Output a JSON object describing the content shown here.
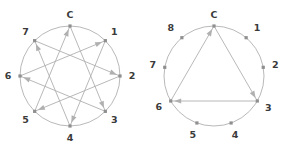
{
  "figures": [
    {
      "id": "octagram-figure",
      "name": "eight-point-star-diagram",
      "point_count": 8,
      "center": {
        "x": 70,
        "y": 76
      },
      "radius": 50,
      "nodes": [
        {
          "label": "C",
          "angle": -90,
          "label_offset": {
            "dx": 0,
            "dy": -11
          }
        },
        {
          "label": "1",
          "angle": -45,
          "label_offset": {
            "dx": 9,
            "dy": -8
          }
        },
        {
          "label": "2",
          "angle": 0,
          "label_offset": {
            "dx": 12,
            "dy": 0
          }
        },
        {
          "label": "3",
          "angle": 45,
          "label_offset": {
            "dx": 9,
            "dy": 9
          }
        },
        {
          "label": "4",
          "angle": 90,
          "label_offset": {
            "dx": 0,
            "dy": 12
          }
        },
        {
          "label": "5",
          "angle": 135,
          "label_offset": {
            "dx": -9,
            "dy": 9
          }
        },
        {
          "label": "6",
          "angle": 180,
          "label_offset": {
            "dx": -12,
            "dy": 0
          }
        },
        {
          "label": "7",
          "angle": -135,
          "label_offset": {
            "dx": -9,
            "dy": -8
          }
        }
      ],
      "edges": [
        {
          "from": 0,
          "to": 3,
          "arrow": true
        },
        {
          "from": 3,
          "to": 6,
          "arrow": true
        },
        {
          "from": 6,
          "to": 1,
          "arrow": true
        },
        {
          "from": 1,
          "to": 4,
          "arrow": true
        },
        {
          "from": 4,
          "to": 7,
          "arrow": true
        },
        {
          "from": 7,
          "to": 2,
          "arrow": true
        },
        {
          "from": 2,
          "to": 5,
          "arrow": true
        },
        {
          "from": 5,
          "to": 0,
          "arrow": true
        }
      ]
    },
    {
      "id": "enneagram-triangle-figure",
      "name": "nine-point-triangle-diagram",
      "point_count": 9,
      "center": {
        "x": 71,
        "y": 76
      },
      "radius": 50,
      "nodes": [
        {
          "label": "C",
          "angle": -90,
          "label_offset": {
            "dx": 0,
            "dy": -11
          }
        },
        {
          "label": "1",
          "angle": -50,
          "label_offset": {
            "dx": 11,
            "dy": -9
          }
        },
        {
          "label": "2",
          "angle": -10,
          "label_offset": {
            "dx": 12,
            "dy": -2
          }
        },
        {
          "label": "3",
          "angle": 30,
          "label_offset": {
            "dx": 11,
            "dy": 7
          }
        },
        {
          "label": "4",
          "angle": 70,
          "label_offset": {
            "dx": 4,
            "dy": 13
          }
        },
        {
          "label": "5",
          "angle": 110,
          "label_offset": {
            "dx": -4,
            "dy": 13
          }
        },
        {
          "label": "6",
          "angle": 150,
          "label_offset": {
            "dx": -12,
            "dy": 6
          }
        },
        {
          "label": "7",
          "angle": 190,
          "label_offset": {
            "dx": -12,
            "dy": -2
          }
        },
        {
          "label": "8",
          "angle": 230,
          "label_offset": {
            "dx": -11,
            "dy": -9
          }
        }
      ],
      "edges": [
        {
          "from": 0,
          "to": 3,
          "arrow": true
        },
        {
          "from": 3,
          "to": 6,
          "arrow": true
        },
        {
          "from": 6,
          "to": 0,
          "arrow": true
        }
      ]
    }
  ],
  "colors": {
    "background": "#ffffff",
    "circle_stroke": "#b9b9b9",
    "edge_stroke": "#b0b0b0",
    "node_fill": "#8f8f8f",
    "label_fill": "#3a3a3a"
  }
}
